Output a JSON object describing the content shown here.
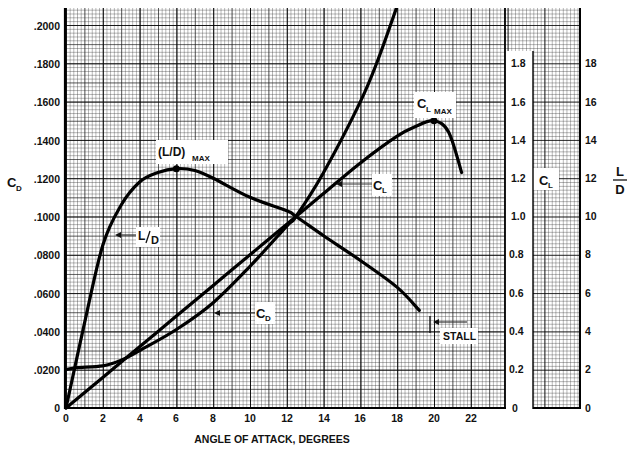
{
  "chart_data": {
    "type": "line",
    "title": "",
    "xlabel": "ANGLE OF ATTACK, DEGREES",
    "x_ticks": [
      "0",
      "2",
      "4",
      "6",
      "8",
      "10",
      "12",
      "14",
      "16",
      "18",
      "20",
      "22"
    ],
    "xlim": [
      0,
      24
    ],
    "grid": true,
    "axes": {
      "left": {
        "label": "C_D",
        "label_main": "C",
        "label_sub": "D",
        "ticks": [
          "0",
          ".0200",
          ".0400",
          ".0600",
          ".0800",
          ".1000",
          ".1200",
          ".1400",
          ".1600",
          ".1800",
          ".2000"
        ],
        "ylim": [
          0,
          0.2
        ]
      },
      "right_inner": {
        "label": "C_L",
        "label_main": "C",
        "label_sub": "L",
        "ticks": [
          "0",
          "0.2",
          "0.4",
          "0.6",
          "0.8",
          "1.0",
          "1.2",
          "1.4",
          "1.6",
          "1.8"
        ],
        "ylim": [
          0,
          2.0
        ]
      },
      "right_outer": {
        "label": "L/D",
        "label_num": "L",
        "label_den": "D",
        "ticks": [
          "0",
          "2",
          "4",
          "6",
          "8",
          "10",
          "12",
          "14",
          "16",
          "18"
        ],
        "ylim": [
          0,
          20
        ]
      }
    },
    "series": [
      {
        "name": "C_L",
        "axis": "right_inner",
        "x": [
          0,
          2,
          4,
          6,
          8,
          10,
          12,
          12.5,
          14,
          16,
          18,
          19,
          20,
          20.8,
          21.5
        ],
        "values": [
          0,
          0.16,
          0.32,
          0.48,
          0.64,
          0.8,
          0.96,
          1.0,
          1.12,
          1.28,
          1.42,
          1.47,
          1.5,
          1.44,
          1.23
        ]
      },
      {
        "name": "C_D",
        "axis": "left",
        "x": [
          0,
          0.5,
          2,
          3,
          4,
          6,
          8,
          10,
          12,
          12.5,
          14,
          16,
          17,
          18
        ],
        "values": [
          0.02,
          0.021,
          0.022,
          0.025,
          0.03,
          0.041,
          0.055,
          0.074,
          0.095,
          0.1,
          0.123,
          0.16,
          0.183,
          0.21
        ]
      },
      {
        "name": "L/D",
        "axis": "right_outer",
        "x": [
          0,
          1,
          2,
          3,
          4,
          5,
          6,
          7,
          8,
          10,
          12,
          12.5,
          14,
          16,
          18,
          19.2
        ],
        "values": [
          0,
          4.4,
          8.5,
          10.6,
          11.8,
          12.3,
          12.5,
          12.4,
          12.0,
          11.0,
          10.3,
          10.0,
          9.0,
          7.7,
          6.3,
          5.1
        ]
      }
    ],
    "annotations": [
      {
        "text": "(L/D) MAX",
        "main": "(L/D)",
        "sub": "MAX",
        "x": 6,
        "y_axis": "right_outer",
        "y": 12.5
      },
      {
        "text": "C_L MAX",
        "main": "C",
        "sub": "L",
        "sub2": "MAX",
        "x": 20,
        "y_axis": "right_inner",
        "y": 1.5
      },
      {
        "text": "C_L",
        "main": "C",
        "sub": "L",
        "arrow_to": {
          "x": 15.2,
          "y": 1.22
        }
      },
      {
        "text": "C_D",
        "main": "C",
        "sub": "D",
        "arrow_to": {
          "x": 9.0,
          "y": 0.066
        }
      },
      {
        "text": "L/D",
        "main": "L",
        "den": "D",
        "arrow_to": {
          "x": 2.8,
          "y": 10.3
        }
      },
      {
        "text": "STALL",
        "arrow_to": {
          "x": 20.6,
          "y": 0.0
        }
      }
    ]
  }
}
